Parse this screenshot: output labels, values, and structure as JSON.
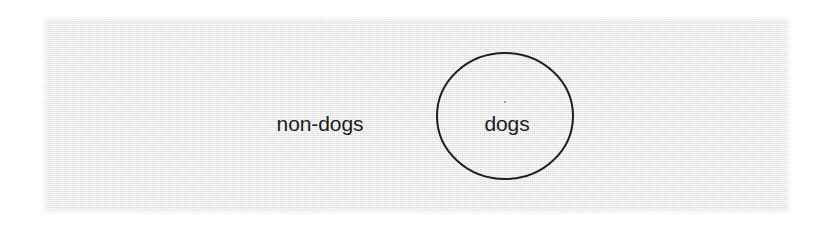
{
  "figure": {
    "kind": "set-diagram",
    "panel": {
      "background_color": "#efefef",
      "page_color": "#ffffff",
      "x": 41,
      "y": 16,
      "width": 751,
      "height": 199
    },
    "ink_color": "#1c1c1c",
    "stroke_color": "#202020",
    "stroke_width": 2
  },
  "labels": {
    "universe": "non-dogs",
    "subset": "dogs"
  },
  "chart_data": {
    "type": "diagram",
    "title": "",
    "sets": [
      {
        "name": "non-dogs",
        "role": "universe",
        "shape": "rectangle",
        "label": "non-dogs",
        "label_x": 320,
        "label_y": 123,
        "x": 41,
        "y": 16,
        "width": 751,
        "height": 199,
        "fill": "#efefef",
        "stroke": "none"
      },
      {
        "name": "dogs",
        "role": "subset",
        "shape": "ellipse",
        "label": "dogs",
        "label_x": 507,
        "label_y": 123,
        "cx": 505,
        "cy": 116,
        "rx": 68,
        "ry": 63,
        "fill": "none",
        "stroke": "#202020",
        "stroke_width": 2
      }
    ],
    "relations": [
      {
        "from": "dogs",
        "to": "non-dogs",
        "type": "contained-in"
      }
    ],
    "legend": null,
    "grid": false
  }
}
